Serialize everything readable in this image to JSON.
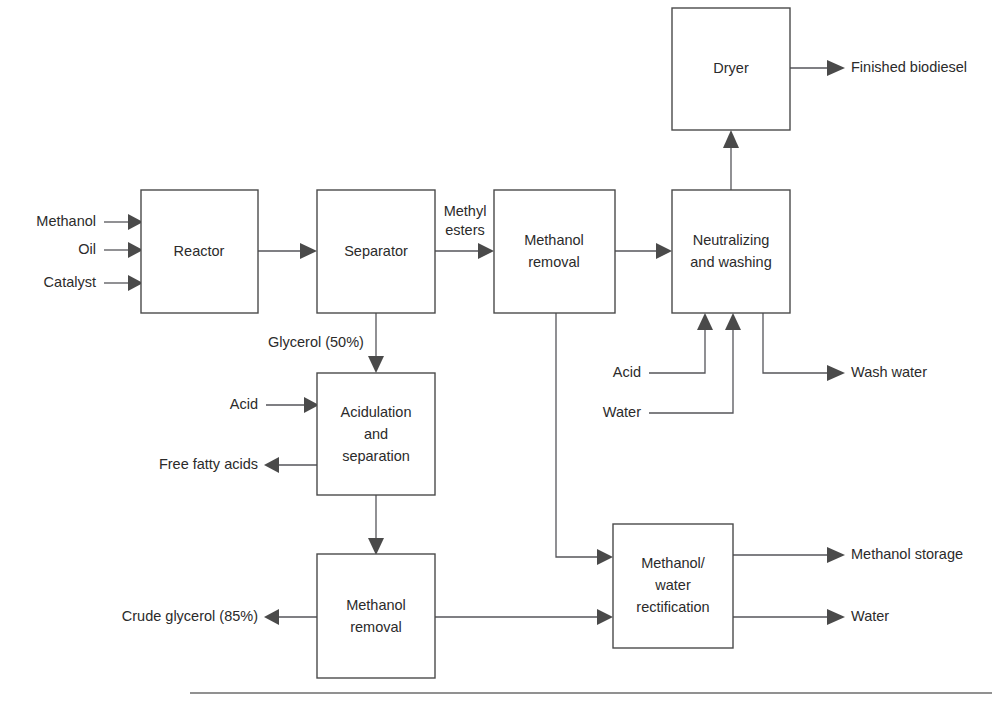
{
  "diagram": {
    "colors": {
      "background": "#ffffff",
      "box_stroke": "#4a4a4a",
      "line_stroke": "#55555a",
      "text": "#2b2b2b",
      "rule": "#6d6d6d"
    },
    "boxes": [
      {
        "id": "dryer",
        "label": "Dryer",
        "lines": [
          "Dryer"
        ],
        "x": 672,
        "y": 8,
        "w": 118,
        "h": 122
      },
      {
        "id": "reactor",
        "label": "Reactor",
        "lines": [
          "Reactor"
        ],
        "x": 141,
        "y": 190,
        "w": 117,
        "h": 123
      },
      {
        "id": "separator",
        "label": "Separator",
        "lines": [
          "Separator"
        ],
        "x": 317,
        "y": 190,
        "w": 118,
        "h": 123
      },
      {
        "id": "methanol-removal-top",
        "label": "Methanol removal",
        "lines": [
          "Methanol",
          "removal"
        ],
        "x": 494,
        "y": 190,
        "w": 121,
        "h": 123
      },
      {
        "id": "neutralizing-washing",
        "label": "Neutralizing and washing",
        "lines": [
          "Neutralizing",
          "and washing"
        ],
        "x": 672,
        "y": 190,
        "w": 118,
        "h": 123
      },
      {
        "id": "acidulation-separation",
        "label": "Acidulation and separation",
        "lines": [
          "Acidulation",
          "and",
          "separation"
        ],
        "x": 317,
        "y": 373,
        "w": 118,
        "h": 122
      },
      {
        "id": "methanol-removal-bottom",
        "label": "Methanol removal",
        "lines": [
          "Methanol",
          "removal"
        ],
        "x": 317,
        "y": 554,
        "w": 118,
        "h": 124
      },
      {
        "id": "methanol-water-rectification",
        "label": "Methanol/water rectification",
        "lines": [
          "Methanol/",
          "water",
          "rectification"
        ],
        "x": 613,
        "y": 524,
        "w": 120,
        "h": 124
      }
    ],
    "stream_labels": [
      {
        "id": "methanol-in",
        "text": "Methanol",
        "x": 96,
        "y": 222,
        "align": "end"
      },
      {
        "id": "oil-in",
        "text": "Oil",
        "x": 96,
        "y": 250,
        "align": "end"
      },
      {
        "id": "catalyst-in",
        "text": "Catalyst",
        "x": 96,
        "y": 283,
        "align": "end"
      },
      {
        "id": "methyl-esters",
        "text": "Methyl",
        "x": 465,
        "y": 212,
        "align": "mid"
      },
      {
        "id": "methyl-esters-2",
        "text": "esters",
        "x": 465,
        "y": 231,
        "align": "mid"
      },
      {
        "id": "finished-biodiesel",
        "text": "Finished biodiesel",
        "x": 851,
        "y": 68,
        "align": "start"
      },
      {
        "id": "glycerol-50",
        "text": "Glycerol (50%)",
        "x": 268,
        "y": 343,
        "align": "start"
      },
      {
        "id": "acid-acidulation",
        "text": "Acid",
        "x": 258,
        "y": 405,
        "align": "end"
      },
      {
        "id": "free-fatty-acids",
        "text": "Free fatty acids",
        "x": 258,
        "y": 465,
        "align": "end"
      },
      {
        "id": "acid-neutralizing",
        "text": "Acid",
        "x": 641,
        "y": 373,
        "align": "end"
      },
      {
        "id": "water-neutralizing",
        "text": "Water",
        "x": 641,
        "y": 413,
        "align": "end"
      },
      {
        "id": "wash-water",
        "text": "Wash water",
        "x": 851,
        "y": 373,
        "align": "start"
      },
      {
        "id": "methanol-storage",
        "text": "Methanol storage",
        "x": 851,
        "y": 555,
        "align": "start"
      },
      {
        "id": "water-out",
        "text": "Water",
        "x": 851,
        "y": 617,
        "align": "start"
      },
      {
        "id": "crude-glycerol-85",
        "text": "Crude glycerol (85%)",
        "x": 258,
        "y": 617,
        "align": "end"
      }
    ]
  }
}
